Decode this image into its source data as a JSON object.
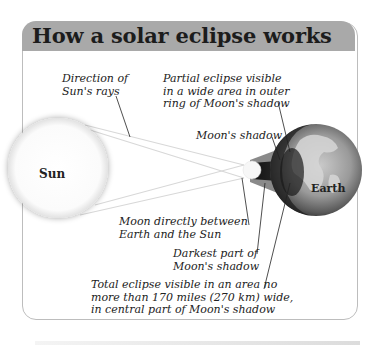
{
  "title": "How a solar eclipse works",
  "bodies": {
    "sun": "Sun",
    "earth": "Earth"
  },
  "labels": {
    "sun_rays": [
      "Direction of",
      "Sun's rays"
    ],
    "partial_eclipse": [
      "Partial eclipse visible",
      "in a wide area in outer",
      "ring of Moon's shadow"
    ],
    "moon_shadow": "Moon's shadow",
    "moon_between": [
      "Moon directly between",
      "Earth and the Sun"
    ],
    "darkest_part": [
      "Darkest part of",
      "Moon's shadow"
    ],
    "total_eclipse": [
      "Total eclipse visible in an area no",
      "more than 170 miles (270 km) wide,",
      "in central part of Moon's shadow"
    ]
  },
  "colors": {
    "header_bg": "#a9a9a9",
    "panel_border": "#bdbdbd",
    "penumbra": "#8a8a8a",
    "umbra": "#2a2a2a",
    "earth_land": "#b5b5b5",
    "earth_dark": "#3a3a3a"
  }
}
